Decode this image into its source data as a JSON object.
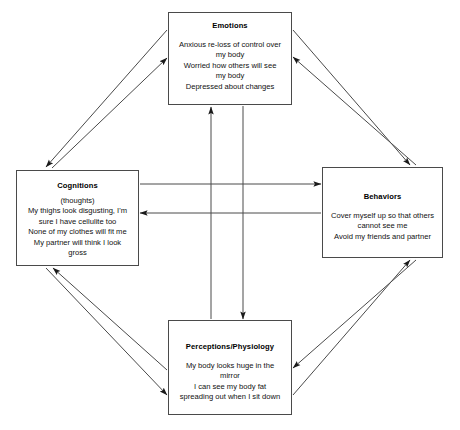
{
  "diagram": {
    "line_color": "#4a4a4a",
    "text_color": "#000000",
    "background": "#ffffff",
    "nodes": [
      {
        "id": "emotions",
        "title": "Emotions",
        "lines": [
          "Anxious re-loss of control over",
          "my body",
          "Worried how others will see",
          "my body",
          "Depressed about changes"
        ]
      },
      {
        "id": "cognitions",
        "title": "Cognitions",
        "lines": [
          "(thoughts)",
          "My thighs look disgusting, I'm",
          "sure I have cellulite too",
          "None of my clothes will fit me",
          "My partner will think I look",
          "gross"
        ]
      },
      {
        "id": "behaviors",
        "title": "Behaviors",
        "lines": [
          "Cover myself up so that others",
          "cannot see me",
          "Avoid my friends and partner"
        ]
      },
      {
        "id": "perceptions",
        "title": "Perceptions/Physiology",
        "lines": [
          "My body looks huge in the",
          "mirror",
          "I can see my body fat",
          "spreading out when I sit down"
        ]
      }
    ],
    "connections": [
      {
        "id": "cognitions-to-emotions",
        "from": "Cognitions",
        "to": "Emotions",
        "style": "diagonal"
      },
      {
        "id": "emotions-to-cognitions",
        "from": "Emotions",
        "to": "Cognitions",
        "style": "diagonal"
      },
      {
        "id": "emotions-to-behaviors",
        "from": "Emotions",
        "to": "Behaviors",
        "style": "diagonal"
      },
      {
        "id": "behaviors-to-emotions",
        "from": "Behaviors",
        "to": "Emotions",
        "style": "diagonal"
      },
      {
        "id": "cognitions-to-perceptions",
        "from": "Cognitions",
        "to": "Perceptions/Physiology",
        "style": "diagonal"
      },
      {
        "id": "perceptions-to-cognitions",
        "from": "Perceptions/Physiology",
        "to": "Cognitions",
        "style": "diagonal"
      },
      {
        "id": "behaviors-to-perceptions",
        "from": "Behaviors",
        "to": "Perceptions/Physiology",
        "style": "diagonal"
      },
      {
        "id": "perceptions-to-behaviors",
        "from": "Perceptions/Physiology",
        "to": "Behaviors",
        "style": "diagonal"
      },
      {
        "id": "cognitions-to-behaviors",
        "from": "Cognitions",
        "to": "Behaviors",
        "style": "horizontal"
      },
      {
        "id": "behaviors-to-cognitions",
        "from": "Behaviors",
        "to": "Cognitions",
        "style": "horizontal"
      },
      {
        "id": "perceptions-to-emotions",
        "from": "Perceptions/Physiology",
        "to": "Emotions",
        "style": "vertical"
      },
      {
        "id": "emotions-to-perceptions",
        "from": "Emotions",
        "to": "Perceptions/Physiology",
        "style": "vertical"
      }
    ]
  }
}
